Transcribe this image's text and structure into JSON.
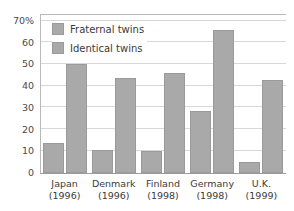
{
  "chart_data": {
    "type": "bar",
    "title": "",
    "xlabel": "",
    "ylabel": "",
    "categories": [
      "Japan",
      "Denmark",
      "Finland",
      "Germany",
      "U.K."
    ],
    "category_sublabels": [
      "(1996)",
      "(1996)",
      "(1998)",
      "(1998)",
      "(1999)"
    ],
    "series": [
      {
        "name": "Fraternal twins",
        "color": "#a9a9a9",
        "values": [
          13.5,
          10.5,
          10,
          28.5,
          5
        ]
      },
      {
        "name": "Identical twins",
        "color": "#a9a9a9",
        "values": [
          50,
          43.5,
          46,
          65.5,
          42.5
        ]
      }
    ],
    "ylim": [
      0,
      73
    ],
    "yticks": [
      0,
      10,
      20,
      30,
      40,
      50,
      60,
      70
    ],
    "ytick_labels": [
      "0",
      "10",
      "20",
      "30",
      "40",
      "50",
      "60",
      "70%"
    ],
    "grid": true,
    "legend_position": "top-left"
  },
  "legend": {
    "items": [
      {
        "label": "Fraternal twins"
      },
      {
        "label": "Identical twins"
      }
    ]
  }
}
